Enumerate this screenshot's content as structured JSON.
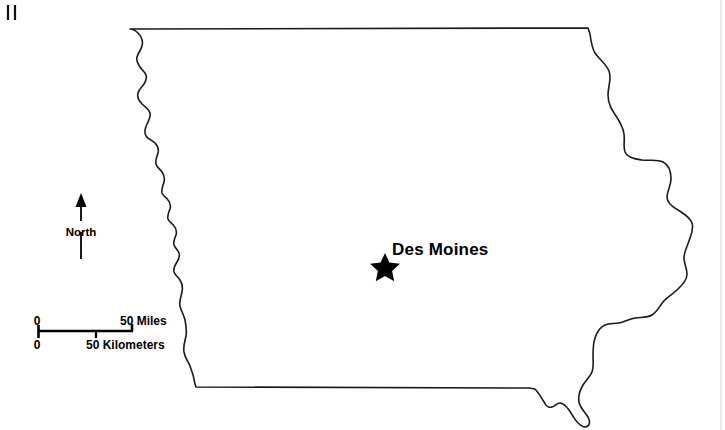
{
  "map": {
    "title": "Iowa State Outline Map",
    "background_color": "#ffffff",
    "outline_color": "#1a1a1a",
    "capital": {
      "name": "Des Moines",
      "marker": "star-marker",
      "marker_x": 385,
      "marker_y": 265,
      "label_x": 392,
      "label_y": 255
    },
    "north_arrow": {
      "label": "North",
      "icon": "north-arrow-icon"
    },
    "scale_bar": {
      "origin_label_top": "0",
      "origin_label_bottom": "0",
      "miles_label": "50 Miles",
      "kilometers_label": "50 Kilometers"
    },
    "corner_marks": {
      "count": 2,
      "description": "crop-mark"
    }
  }
}
